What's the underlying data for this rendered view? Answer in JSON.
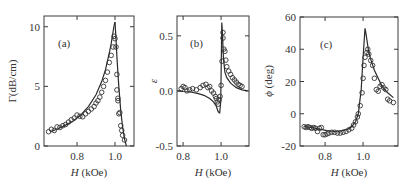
{
  "chart_data": [
    {
      "type": "scatter",
      "panel_label": "(a)",
      "xlabel_italic": "H",
      "xlabel_rest": " (kOe)",
      "ylabel": "Γ(dB/cm)",
      "xlim": [
        0.626,
        1.1
      ],
      "ylim": [
        0,
        10.9
      ],
      "xticks": [
        0.8,
        1.0
      ],
      "xtick_labels": [
        "0.8",
        "1.0"
      ],
      "yticks": [
        0,
        5,
        10
      ],
      "ytick_labels": [
        "0",
        "5",
        "10"
      ],
      "series": [
        {
          "name": "fit-lower",
          "kind": "line",
          "x": [
            0.66,
            0.7,
            0.74,
            0.78,
            0.82,
            0.86,
            0.9,
            0.93,
            0.95,
            0.97,
            0.98,
            0.99,
            0.995,
            1.0
          ],
          "y": [
            1.2,
            1.45,
            1.75,
            2.1,
            2.6,
            3.3,
            4.3,
            5.4,
            6.4,
            7.8,
            8.6,
            9.6,
            10.1,
            10.4
          ]
        },
        {
          "name": "fit-upper",
          "kind": "line",
          "x": [
            1.0,
            1.005,
            1.01,
            1.02,
            1.03,
            1.04,
            1.05,
            1.06
          ],
          "y": [
            10.4,
            9.0,
            7.5,
            5.0,
            3.0,
            1.6,
            0.6,
            0.0
          ]
        },
        {
          "name": "measured",
          "kind": "markers",
          "x": [
            0.65,
            0.665,
            0.68,
            0.695,
            0.71,
            0.725,
            0.74,
            0.755,
            0.77,
            0.785,
            0.8,
            0.815,
            0.83,
            0.845,
            0.86,
            0.875,
            0.89,
            0.9,
            0.91,
            0.92,
            0.93,
            0.94,
            0.95,
            0.96,
            0.97,
            0.98,
            0.99,
            0.995,
            1.0,
            1.005,
            1.01,
            1.01,
            1.015,
            1.015,
            1.02,
            1.025,
            1.03,
            1.035,
            1.04,
            1.05
          ],
          "y": [
            1.2,
            1.4,
            1.3,
            1.6,
            1.55,
            1.7,
            1.8,
            2.0,
            2.2,
            2.35,
            2.6,
            2.5,
            2.45,
            2.7,
            2.9,
            3.1,
            3.3,
            3.6,
            3.8,
            4.1,
            4.5,
            5.0,
            5.5,
            6.2,
            7.0,
            7.6,
            8.3,
            9.2,
            9.0,
            8.3,
            6.0,
            4.7,
            4.0,
            3.8,
            2.7,
            2.8,
            1.7,
            1.3,
            0.9,
            0.5
          ]
        }
      ]
    },
    {
      "type": "scatter",
      "panel_label": "(b)",
      "xlabel_italic": "H",
      "xlabel_rest": " (kOe)",
      "ylabel": "ε",
      "xlim": [
        0.768,
        1.147
      ],
      "ylim": [
        -0.5,
        0.68
      ],
      "xticks": [
        0.8,
        1.0
      ],
      "xtick_labels": [
        "0.8",
        "1.0"
      ],
      "yticks": [
        -0.5,
        0.0,
        0.5
      ],
      "ytick_labels": [
        "-0.5",
        "0.0",
        "0.5"
      ],
      "series": [
        {
          "name": "fit",
          "kind": "line",
          "x": [
            0.77,
            0.8,
            0.84,
            0.88,
            0.91,
            0.94,
            0.96,
            0.975,
            0.985,
            0.993,
            0.998,
            1.0,
            1.004,
            1.008,
            1.012,
            1.02,
            1.03,
            1.05,
            1.08,
            1.11,
            1.14
          ],
          "y": [
            0.0,
            -0.005,
            -0.01,
            -0.025,
            -0.04,
            -0.07,
            -0.1,
            -0.14,
            -0.19,
            -0.2,
            -0.1,
            0.15,
            0.62,
            0.5,
            0.3,
            0.17,
            0.12,
            0.07,
            0.03,
            0.01,
            0.0
          ]
        },
        {
          "name": "measured",
          "kind": "markers",
          "x": [
            0.79,
            0.8,
            0.81,
            0.82,
            0.835,
            0.85,
            0.87,
            0.89,
            0.905,
            0.92,
            0.93,
            0.94,
            0.95,
            0.96,
            0.97,
            0.975,
            0.98,
            0.985,
            0.99,
            0.995,
            1.0,
            1.005,
            1.01,
            1.01,
            1.015,
            1.02,
            1.025,
            1.03,
            1.04,
            1.05,
            1.06,
            1.07,
            1.08,
            1.09,
            1.1,
            1.11
          ],
          "y": [
            0.02,
            0.04,
            0.03,
            0.0,
            0.01,
            0.02,
            0.01,
            0.03,
            0.05,
            0.06,
            0.03,
            0.04,
            0.0,
            -0.02,
            -0.05,
            -0.07,
            -0.1,
            -0.12,
            -0.08,
            -0.05,
            0.05,
            0.27,
            0.48,
            0.53,
            0.38,
            0.36,
            0.28,
            0.22,
            0.18,
            0.15,
            0.12,
            0.1,
            0.08,
            0.06,
            0.05,
            0.04
          ]
        }
      ]
    },
    {
      "type": "scatter",
      "panel_label": "(c)",
      "xlabel_italic": "H",
      "xlabel_rest": " (kOe)",
      "ylabel_italic": "ϕ",
      "ylabel_rest": " (deg)",
      "xlim": [
        0.668,
        1.184
      ],
      "ylim": [
        -20,
        60
      ],
      "xticks": [
        0.8,
        1.0
      ],
      "xtick_labels": [
        "0.8",
        "1.0"
      ],
      "yticks": [
        -20,
        0,
        20,
        40,
        60
      ],
      "ytick_labels": [
        "-20",
        "0",
        "20",
        "40",
        "60"
      ],
      "series": [
        {
          "name": "fit",
          "kind": "line",
          "x": [
            0.69,
            0.73,
            0.77,
            0.81,
            0.85,
            0.89,
            0.92,
            0.94,
            0.96,
            0.975,
            0.99,
            1.0,
            1.01,
            1.015,
            1.03,
            1.045,
            1.06,
            1.08,
            1.1,
            1.13,
            1.16
          ],
          "y": [
            -8,
            -8.5,
            -9.5,
            -10.5,
            -11,
            -10.5,
            -9.5,
            -8,
            -5,
            0,
            15,
            35,
            53,
            50,
            38,
            32,
            27,
            22,
            17,
            13,
            10
          ]
        },
        {
          "name": "measured",
          "kind": "markers",
          "x": [
            0.69,
            0.7,
            0.71,
            0.72,
            0.73,
            0.74,
            0.75,
            0.76,
            0.77,
            0.78,
            0.79,
            0.8,
            0.81,
            0.82,
            0.835,
            0.85,
            0.865,
            0.88,
            0.895,
            0.91,
            0.925,
            0.94,
            0.95,
            0.96,
            0.97,
            0.975,
            0.985,
            0.995,
            1.0,
            1.005,
            1.01,
            1.02,
            1.025,
            1.03,
            1.04,
            1.05,
            1.06,
            1.07,
            1.08,
            1.09,
            1.1,
            1.11,
            1.12,
            1.13,
            1.14,
            1.16
          ],
          "y": [
            -8,
            -8.5,
            -8,
            -8.5,
            -9,
            -8.5,
            -9,
            -11,
            -9,
            -8.5,
            -13,
            -13,
            -12.5,
            -12,
            -11.5,
            -11.5,
            -12,
            -12,
            -11.5,
            -11,
            -10,
            -9,
            -7,
            -5,
            -2,
            0,
            5,
            13,
            22,
            30,
            35,
            38,
            40,
            37,
            33,
            30,
            22,
            15,
            14,
            17,
            18,
            16,
            15,
            9,
            8,
            7
          ]
        }
      ]
    }
  ]
}
